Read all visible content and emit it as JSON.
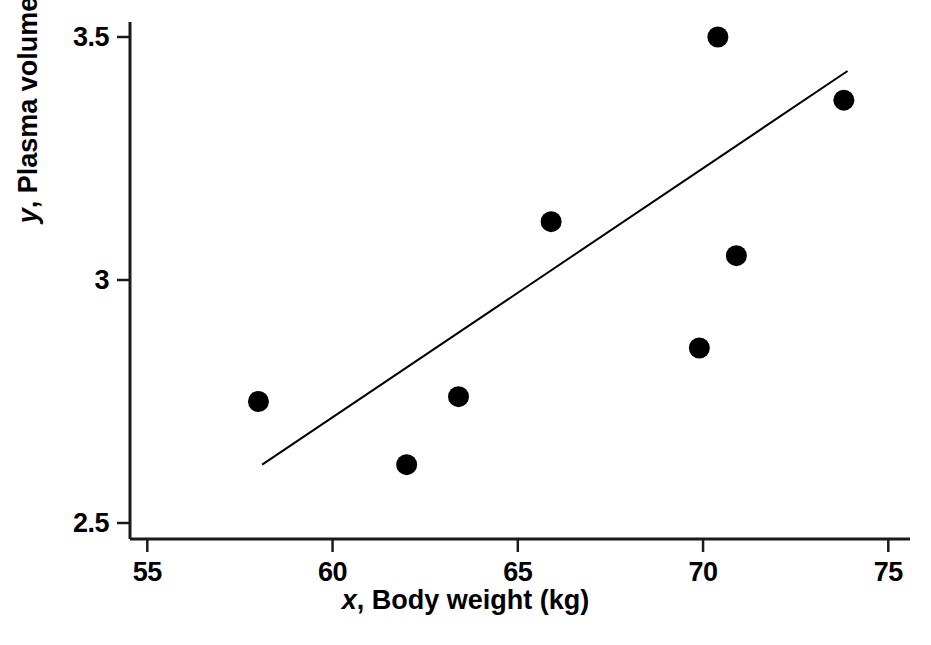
{
  "chart_data": {
    "type": "scatter",
    "title": "",
    "xlabel": "x, Body weight (kg)",
    "ylabel": "y, Plasma volume (litres)",
    "xlabel_italic_prefix": "x",
    "xlabel_rest": ", Body weight (kg)",
    "ylabel_italic_prefix": "y",
    "ylabel_rest": ", Plasma volume (litres)",
    "xlim": [
      54.0,
      75.6
    ],
    "ylim": [
      2.47,
      3.53
    ],
    "xticks": [
      55,
      60,
      65,
      70,
      75
    ],
    "xtick_labels": [
      "55",
      "60",
      "65",
      "70",
      "75"
    ],
    "yticks": [
      2.5,
      3.0,
      3.5
    ],
    "ytick_labels": [
      "2.5",
      "3",
      "3.5"
    ],
    "grid": false,
    "legend": null,
    "marker": {
      "shape": "circle",
      "color": "#000000",
      "size_px": 21
    },
    "points": [
      {
        "x": 58.0,
        "y": 2.75
      },
      {
        "x": 62.0,
        "y": 2.62
      },
      {
        "x": 63.4,
        "y": 2.76
      },
      {
        "x": 65.9,
        "y": 3.12
      },
      {
        "x": 69.9,
        "y": 2.86
      },
      {
        "x": 70.4,
        "y": 3.5
      },
      {
        "x": 70.9,
        "y": 3.05
      },
      {
        "x": 73.8,
        "y": 3.37
      }
    ],
    "fit_line": {
      "label": "regression-line",
      "color": "#000000",
      "width_px": 2,
      "x_start": 58.1,
      "y_start": 2.62,
      "x_end": 73.9,
      "y_end": 3.43
    },
    "axes_style": {
      "line_color": "#1a1a1a",
      "line_width_px": 3,
      "tick_length_px": 13,
      "spines": [
        "left",
        "bottom"
      ]
    }
  }
}
